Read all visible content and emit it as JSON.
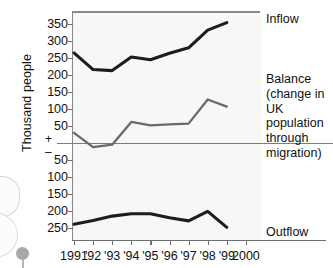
{
  "chart_data": {
    "type": "line",
    "title": "",
    "xlabel": "",
    "ylabel": "Thousand people",
    "x": [
      "1991",
      "1992",
      "1993",
      "1994",
      "1995",
      "1996",
      "1997",
      "1998",
      "1999"
    ],
    "xtick_labels": [
      "1991",
      "'92",
      "'93",
      "'94",
      "'95",
      "'96",
      "'97",
      "'98",
      "'99",
      "2000"
    ],
    "ytick_labels_upper": [
      "350",
      "300",
      "250",
      "200",
      "150",
      "100",
      "50"
    ],
    "ytick_labels_lower": [
      "50",
      "100",
      "150",
      "200",
      "250"
    ],
    "ylim": [
      -270,
      370
    ],
    "grid": false,
    "zero_line": true,
    "sign_positive": "+",
    "sign_negative": "–",
    "legend_position": "right-inline",
    "series": [
      {
        "name": "Inflow",
        "label": "Inflow",
        "color": "#1d1d1d",
        "values": [
          265,
          216,
          213,
          253,
          245,
          264,
          280,
          332,
          354
        ]
      },
      {
        "name": "Balance",
        "label": "Balance\n(change in UK\npopulation\nthrough\nmigration)",
        "color": "#6a6a6a",
        "values": [
          30,
          -12,
          -5,
          62,
          52,
          55,
          57,
          128,
          107
        ]
      },
      {
        "name": "Outflow",
        "label": "Outflow",
        "color": "#1d1d1d",
        "values": [
          -239,
          -228,
          -215,
          -208,
          -208,
          -220,
          -229,
          -201,
          -248
        ]
      }
    ]
  }
}
